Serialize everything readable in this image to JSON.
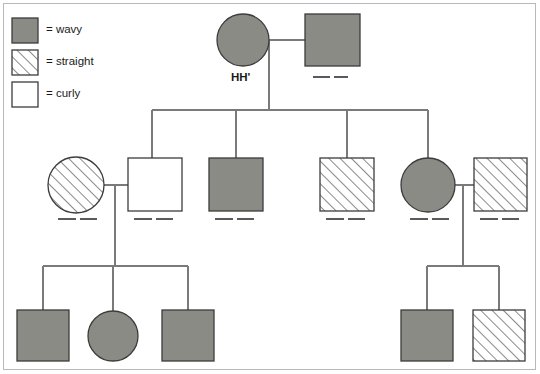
{
  "figure": {
    "type": "pedigree-chart",
    "title": "",
    "background_color": "#ffffff",
    "border_color": "#b9b9b9"
  },
  "styles": {
    "shaded_fill": "#8b8b85",
    "hatched_fill": "#ffffff",
    "hatch_line_color": "#4a4a4a",
    "open_fill": "#ffffff",
    "shape_stroke": "#3c3c3c",
    "line_color": "#7a7a7a",
    "blank_color": "#5a5a5a"
  },
  "legend": {
    "items": [
      {
        "key": "shaded",
        "pattern": "shaded",
        "label": "= wavy",
        "x": 12,
        "y": 18
      },
      {
        "key": "hatched",
        "pattern": "hatched",
        "label": "= straight",
        "x": 12,
        "y": 50
      },
      {
        "key": "open",
        "pattern": "open",
        "label": "= curly",
        "x": 12,
        "y": 82
      }
    ]
  },
  "generations": [
    {
      "name": "generation-1",
      "individuals": [
        {
          "id": "I-1",
          "sex": "female",
          "shape": "circle",
          "pattern": "shaded",
          "cx": 243,
          "cy": 40,
          "r": 26,
          "label": "HH'",
          "label_x": 231,
          "label_y": 71,
          "blanks": []
        },
        {
          "id": "I-2",
          "sex": "male",
          "shape": "square",
          "pattern": "shaded",
          "x": 305,
          "y": 14,
          "w": 55,
          "h": 52,
          "label": "",
          "blanks": [
            {
              "x1": 313,
              "y": 77,
              "x2": 330
            },
            {
              "x1": 334,
              "y": 77,
              "x2": 348
            }
          ]
        }
      ]
    },
    {
      "name": "generation-2",
      "individuals": [
        {
          "id": "II-1",
          "sex": "female",
          "shape": "circle",
          "pattern": "hatched",
          "cx": 76,
          "cy": 185,
          "r": 28,
          "label": "",
          "blanks": [
            {
              "x1": 58,
              "y": 219,
              "x2": 76
            },
            {
              "x1": 80,
              "y": 219,
              "x2": 97
            }
          ]
        },
        {
          "id": "II-2",
          "sex": "male",
          "shape": "square",
          "pattern": "open",
          "x": 128,
          "y": 158,
          "w": 54,
          "h": 53,
          "label": "",
          "blanks": [
            {
              "x1": 134,
              "y": 219,
              "x2": 152
            },
            {
              "x1": 156,
              "y": 219,
              "x2": 173
            }
          ]
        },
        {
          "id": "II-3",
          "sex": "male",
          "shape": "square",
          "pattern": "shaded",
          "x": 209,
          "y": 158,
          "w": 54,
          "h": 53,
          "label": "",
          "blanks": [
            {
              "x1": 215,
              "y": 219,
              "x2": 233
            },
            {
              "x1": 237,
              "y": 219,
              "x2": 254
            }
          ]
        },
        {
          "id": "II-4",
          "sex": "male",
          "shape": "square",
          "pattern": "hatched",
          "x": 320,
          "y": 158,
          "w": 54,
          "h": 53,
          "label": "",
          "blanks": [
            {
              "x1": 326,
              "y": 219,
              "x2": 344
            },
            {
              "x1": 348,
              "y": 219,
              "x2": 365
            }
          ]
        },
        {
          "id": "II-5",
          "sex": "female",
          "shape": "circle",
          "pattern": "shaded",
          "cx": 428,
          "cy": 185,
          "r": 27,
          "label": "",
          "blanks": [
            {
              "x1": 410,
              "y": 219,
              "x2": 428
            },
            {
              "x1": 432,
              "y": 219,
              "x2": 449
            }
          ]
        },
        {
          "id": "II-6",
          "sex": "male",
          "shape": "square",
          "pattern": "hatched",
          "x": 474,
          "y": 158,
          "w": 53,
          "h": 53,
          "label": "",
          "blanks": [
            {
              "x1": 480,
              "y": 219,
              "x2": 498
            },
            {
              "x1": 502,
              "y": 219,
              "x2": 519
            }
          ]
        }
      ]
    },
    {
      "name": "generation-3",
      "individuals": [
        {
          "id": "III-1",
          "sex": "male",
          "shape": "square",
          "pattern": "shaded",
          "x": 17,
          "y": 310,
          "w": 52,
          "h": 51,
          "label": "",
          "blanks": []
        },
        {
          "id": "III-2",
          "sex": "female",
          "shape": "circle",
          "pattern": "shaded",
          "cx": 113,
          "cy": 336,
          "r": 25,
          "label": "",
          "blanks": []
        },
        {
          "id": "III-3",
          "sex": "male",
          "shape": "square",
          "pattern": "shaded",
          "x": 162,
          "y": 310,
          "w": 52,
          "h": 51,
          "label": "",
          "blanks": []
        },
        {
          "id": "III-4",
          "sex": "male",
          "shape": "square",
          "pattern": "shaded",
          "x": 401,
          "y": 310,
          "w": 52,
          "h": 51,
          "label": "",
          "blanks": []
        },
        {
          "id": "III-5",
          "sex": "male",
          "shape": "square",
          "pattern": "hatched",
          "x": 473,
          "y": 310,
          "w": 52,
          "h": 51,
          "label": "",
          "blanks": []
        }
      ]
    }
  ],
  "connections": {
    "matings": [
      {
        "name": "mating-gen1",
        "x1": 269,
        "y": 40,
        "x2": 305
      },
      {
        "name": "mating-gen2-left",
        "x1": 104,
        "y": 185,
        "x2": 128
      },
      {
        "name": "mating-gen2-right",
        "x1": 455,
        "y": 185,
        "x2": 474
      }
    ],
    "descent_lines": [
      {
        "name": "descent-gen1",
        "x": 269,
        "y1": 40,
        "y2": 110
      },
      {
        "name": "descent-gen2-left",
        "x": 115,
        "y1": 185,
        "y2": 266
      },
      {
        "name": "descent-gen2-right",
        "x": 463,
        "y1": 185,
        "y2": 266
      }
    ],
    "sibship_bars": [
      {
        "name": "sibship-gen2",
        "x1": 152,
        "y": 110,
        "x2": 428
      },
      {
        "name": "sibship-gen3-left",
        "x1": 43,
        "y": 266,
        "x2": 188
      },
      {
        "name": "sibship-gen3-right",
        "x1": 427,
        "y": 266,
        "x2": 499
      }
    ],
    "drop_lines": [
      {
        "name": "drop-to-II-2",
        "x": 152,
        "y1": 110,
        "y2": 158
      },
      {
        "name": "drop-to-II-3",
        "x": 236,
        "y1": 110,
        "y2": 158
      },
      {
        "name": "drop-to-II-4",
        "x": 347,
        "y1": 110,
        "y2": 158
      },
      {
        "name": "drop-to-II-5",
        "x": 428,
        "y1": 110,
        "y2": 158
      },
      {
        "name": "drop-to-III-1",
        "x": 43,
        "y1": 266,
        "y2": 310
      },
      {
        "name": "drop-to-III-2",
        "x": 113,
        "y1": 266,
        "y2": 311
      },
      {
        "name": "drop-to-III-3",
        "x": 188,
        "y1": 266,
        "y2": 310
      },
      {
        "name": "drop-to-III-4",
        "x": 427,
        "y1": 266,
        "y2": 310
      },
      {
        "name": "drop-to-III-5",
        "x": 499,
        "y1": 266,
        "y2": 310
      }
    ]
  }
}
